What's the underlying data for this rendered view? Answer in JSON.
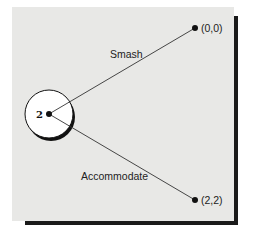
{
  "diagram": {
    "type": "game-tree",
    "decision_node": {
      "player": "2"
    },
    "branches": [
      {
        "action": "Smash",
        "payoff": "(0,0)"
      },
      {
        "action": "Accommodate",
        "payoff": "(2,2)"
      }
    ]
  }
}
